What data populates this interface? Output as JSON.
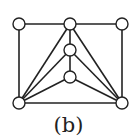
{
  "caption": "(b)",
  "graph": {
    "nodes": [
      {
        "id": "tl",
        "x": 19,
        "y": 24
      },
      {
        "id": "tm",
        "x": 70,
        "y": 24
      },
      {
        "id": "tr",
        "x": 122,
        "y": 24
      },
      {
        "id": "m1",
        "x": 70,
        "y": 50
      },
      {
        "id": "m2",
        "x": 70,
        "y": 77
      },
      {
        "id": "bl",
        "x": 19,
        "y": 103
      },
      {
        "id": "br",
        "x": 122,
        "y": 103
      }
    ],
    "edges": [
      [
        "tl",
        "tm"
      ],
      [
        "tm",
        "tr"
      ],
      [
        "tl",
        "bl"
      ],
      [
        "tr",
        "br"
      ],
      [
        "bl",
        "br"
      ],
      [
        "tm",
        "bl"
      ],
      [
        "tm",
        "br"
      ],
      [
        "tm",
        "m1"
      ],
      [
        "m1",
        "m2"
      ],
      [
        "m1",
        "bl"
      ],
      [
        "m1",
        "br"
      ],
      [
        "m2",
        "bl"
      ],
      [
        "m2",
        "br"
      ]
    ],
    "node_radius": 6,
    "stroke_color": "#222222",
    "fill_color": "#ffffff"
  }
}
